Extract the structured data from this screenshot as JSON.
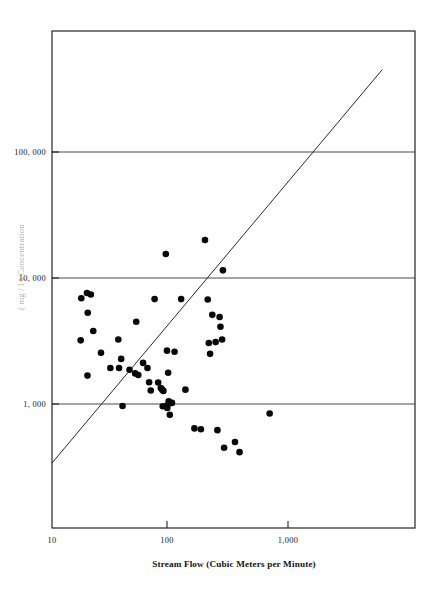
{
  "figure": {
    "background_color": "#ffffff",
    "ink_color": "#111111"
  },
  "chart_data": {
    "type": "scatter",
    "title": "",
    "subtitle": "",
    "xlabel": "Stream Flow  (Cubic Meters per Minute)",
    "ylabel": "Suspended Sediment Concentration  (mg / l)",
    "ylabel_visible_fragment": "( mg / l )   Concentration",
    "xscale": "log",
    "yscale": "log",
    "xlim": [
      10,
      5500
    ],
    "ylim": [
      310,
      480000
    ],
    "grid": true,
    "grid_axis": "y",
    "legend": "none",
    "xticks": [
      10,
      100,
      1000
    ],
    "xtick_labels": [
      "10",
      "100",
      "1,000"
    ],
    "yticks": [
      1000,
      10000,
      100000
    ],
    "ytick_labels": [
      "1, 000",
      "10, 000",
      "100, 000"
    ],
    "marker": "filled-circle",
    "marker_color": "#080808",
    "marker_size_px": 4.6,
    "n_points": 55,
    "points": [
      {
        "x": 17.5,
        "y": 6900
      },
      {
        "x": 19.5,
        "y": 7600
      },
      {
        "x": 19.8,
        "y": 5300
      },
      {
        "x": 17.3,
        "y": 3200
      },
      {
        "x": 22.0,
        "y": 3800
      },
      {
        "x": 25.5,
        "y": 2550
      },
      {
        "x": 19.7,
        "y": 1680
      },
      {
        "x": 30.5,
        "y": 1930
      },
      {
        "x": 35.5,
        "y": 3250
      },
      {
        "x": 37.5,
        "y": 2280
      },
      {
        "x": 36.0,
        "y": 1930
      },
      {
        "x": 38.5,
        "y": 965
      },
      {
        "x": 49.0,
        "y": 1750
      },
      {
        "x": 52.0,
        "y": 1700
      },
      {
        "x": 50.0,
        "y": 4500
      },
      {
        "x": 57.0,
        "y": 2120
      },
      {
        "x": 62.0,
        "y": 1930
      },
      {
        "x": 64.0,
        "y": 1490
      },
      {
        "x": 66.0,
        "y": 1280
      },
      {
        "x": 71.0,
        "y": 6800
      },
      {
        "x": 80.0,
        "y": 1340
      },
      {
        "x": 82.0,
        "y": 1300
      },
      {
        "x": 84.0,
        "y": 1270
      },
      {
        "x": 83.0,
        "y": 960
      },
      {
        "x": 88.0,
        "y": 15500
      },
      {
        "x": 90.0,
        "y": 2650
      },
      {
        "x": 92.0,
        "y": 1770
      },
      {
        "x": 93.0,
        "y": 1050
      },
      {
        "x": 91.0,
        "y": 980
      },
      {
        "x": 90.5,
        "y": 930
      },
      {
        "x": 95.0,
        "y": 820
      },
      {
        "x": 118.0,
        "y": 6800
      },
      {
        "x": 128.0,
        "y": 1300
      },
      {
        "x": 152.0,
        "y": 640
      },
      {
        "x": 186.0,
        "y": 20000
      },
      {
        "x": 196.0,
        "y": 6750
      },
      {
        "x": 200.0,
        "y": 3050
      },
      {
        "x": 205.0,
        "y": 2500
      },
      {
        "x": 214.0,
        "y": 5100
      },
      {
        "x": 228.0,
        "y": 3100
      },
      {
        "x": 236.0,
        "y": 620
      },
      {
        "x": 246.0,
        "y": 4900
      },
      {
        "x": 250.0,
        "y": 4100
      },
      {
        "x": 258.0,
        "y": 3250
      },
      {
        "x": 262.0,
        "y": 11500
      },
      {
        "x": 268.0,
        "y": 450
      },
      {
        "x": 330.0,
        "y": 500
      },
      {
        "x": 360.0,
        "y": 415
      },
      {
        "x": 640.0,
        "y": 840
      },
      {
        "x": 21.0,
        "y": 7400
      },
      {
        "x": 44.0,
        "y": 1870
      },
      {
        "x": 76.0,
        "y": 1480
      },
      {
        "x": 99.0,
        "y": 1020
      },
      {
        "x": 104.0,
        "y": 2600
      },
      {
        "x": 172.0,
        "y": 630
      }
    ],
    "annotations": [
      {
        "name": "trend-line",
        "type": "line",
        "description": "Straight regression line on log-log axes",
        "start": {
          "x": 10,
          "y": 340
        },
        "end": {
          "x": 5500,
          "y": 450000
        }
      }
    ]
  },
  "axes": {
    "x_title": "Stream Flow  (Cubic Meters per Minute)",
    "y_title_fragment": "( mg / l )   Concentration",
    "x_tick_labels": [
      "10",
      "100",
      "1,000"
    ],
    "y_tick_labels": [
      "1, 000",
      "10, 000",
      "100, 000"
    ]
  }
}
